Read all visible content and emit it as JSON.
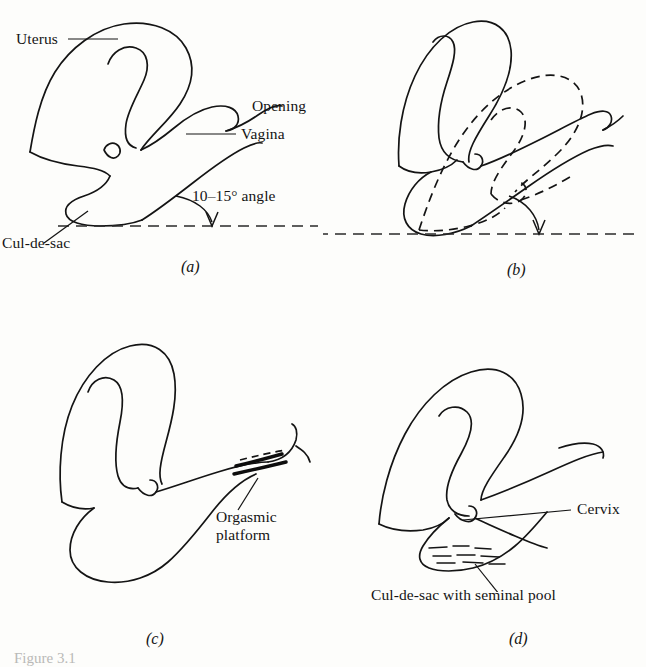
{
  "figure": {
    "caption": "Figure 3.1",
    "background_color": "#fdfdfb",
    "ink_color": "#141414"
  },
  "panels": [
    {
      "id": "a",
      "letter": "(a)",
      "description": "Unstimulated position of uterus and vagina showing resting angle",
      "labels": [
        {
          "name": "uterus",
          "text": "Uterus"
        },
        {
          "name": "opening",
          "text": "Opening"
        },
        {
          "name": "vagina",
          "text": "Vagina"
        },
        {
          "name": "angle",
          "text": "10–15° angle"
        },
        {
          "name": "cul-de-sac",
          "text": "Cul-de-sac"
        }
      ]
    },
    {
      "id": "b",
      "letter": "(b)",
      "description": "Uterine elevation (tenting); dashed outline shows unstimulated position",
      "labels": []
    },
    {
      "id": "c",
      "letter": "(c)",
      "description": "Orgasmic platform formed in outer third of vagina",
      "labels": [
        {
          "name": "orgasmic-platform",
          "text": "Orgasmic\nplatform"
        }
      ]
    },
    {
      "id": "d",
      "letter": "(d)",
      "description": "Resolution with cervix lowered into the seminal pool",
      "labels": [
        {
          "name": "cervix",
          "text": "Cervix"
        },
        {
          "name": "cul-de-sac-seminal-pool",
          "text": "Cul-de-sac with seminal pool"
        }
      ]
    }
  ]
}
